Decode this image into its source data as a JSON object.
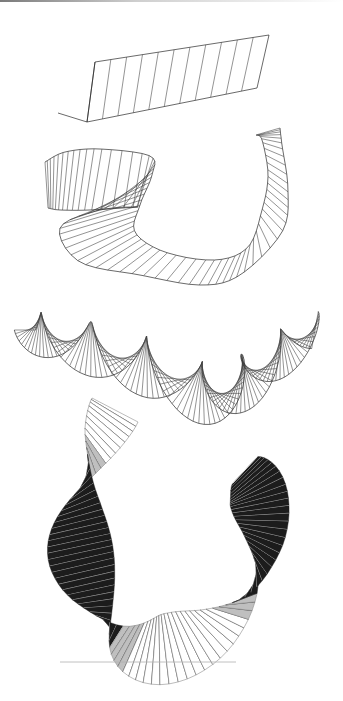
{
  "figure": {
    "colors": {
      "background": "#ffffff",
      "line": "#333333",
      "dark_face": "#1c1c1c",
      "top_bar_start": "#7a7a7a",
      "top_bar_end": "#ffffff"
    },
    "panels": [
      {
        "id": "flat-strip",
        "label": "",
        "type": "straight ribbon",
        "top_edge": [
          [
            95,
            62
          ],
          [
            269,
            35
          ]
        ],
        "bottom_edge": [
          [
            87,
            122
          ],
          [
            257,
            88
          ]
        ],
        "cap": [
          [
            58,
            113
          ],
          [
            87,
            122
          ],
          [
            95,
            62
          ]
        ],
        "rulings": 11
      },
      {
        "id": "bent-ribbon",
        "label": "",
        "type": "curved ribbon",
        "top_edge": [
          [
            45,
            162
          ],
          [
            65,
            152
          ],
          [
            100,
            149
          ],
          [
            150,
            156
          ],
          [
            152,
            175
          ],
          [
            140,
            205
          ],
          [
            135,
            232
          ],
          [
            165,
            252
          ],
          [
            215,
            260
          ],
          [
            248,
            247
          ],
          [
            262,
            210
          ],
          [
            268,
            175
          ],
          [
            262,
            140
          ],
          [
            256,
            135
          ]
        ],
        "bottom_edge": [
          [
            48,
            208
          ],
          [
            60,
            210
          ],
          [
            90,
            210
          ],
          [
            138,
            207
          ],
          [
            100,
            210
          ],
          [
            60,
            228
          ],
          [
            80,
            262
          ],
          [
            140,
            275
          ],
          [
            200,
            285
          ],
          [
            240,
            275
          ],
          [
            282,
            232
          ],
          [
            288,
            190
          ],
          [
            282,
            145
          ],
          [
            280,
            128
          ]
        ],
        "rulings": 70
      },
      {
        "id": "twisted-ribbon",
        "label": "",
        "type": "helical ribbon",
        "axis": [
          [
            25,
            330
          ],
          [
            60,
            340
          ],
          [
            110,
            355
          ],
          [
            160,
            372
          ],
          [
            210,
            395
          ],
          [
            245,
            382
          ],
          [
            280,
            355
          ],
          [
            315,
            330
          ]
        ],
        "amplitude": 26,
        "twist_turns": 3.2,
        "rulings": 120
      },
      {
        "id": "shaded-loop",
        "label": "",
        "type": "shaded twisted U-ribbon",
        "rulings": 90,
        "ground_line": [
          [
            60,
            662
          ],
          [
            236,
            662
          ]
        ]
      }
    ]
  }
}
